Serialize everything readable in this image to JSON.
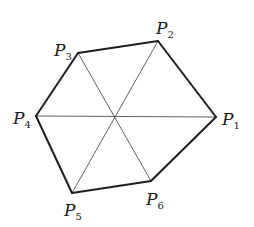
{
  "diagram": {
    "vertices": [
      {
        "id": "P1",
        "letter": "P",
        "sub": "1",
        "x": 216,
        "y": 117,
        "label_x": 222,
        "label_y": 125
      },
      {
        "id": "P2",
        "letter": "P",
        "sub": "2",
        "x": 158,
        "y": 41,
        "label_x": 156,
        "label_y": 34
      },
      {
        "id": "P3",
        "letter": "P",
        "sub": "3",
        "x": 78,
        "y": 53,
        "label_x": 54,
        "label_y": 56
      },
      {
        "id": "P4",
        "letter": "P",
        "sub": "4",
        "x": 36,
        "y": 116,
        "label_x": 13,
        "label_y": 124
      },
      {
        "id": "P5",
        "letter": "P",
        "sub": "5",
        "x": 72,
        "y": 193,
        "label_x": 64,
        "label_y": 216
      },
      {
        "id": "P6",
        "letter": "P",
        "sub": "6",
        "x": 151,
        "y": 181,
        "label_x": 146,
        "label_y": 205
      }
    ],
    "center": {
      "x": 114,
      "y": 116
    },
    "edges": [
      [
        "P1",
        "P2"
      ],
      [
        "P2",
        "P3"
      ],
      [
        "P3",
        "P4"
      ],
      [
        "P4",
        "P5"
      ],
      [
        "P5",
        "P6"
      ],
      [
        "P6",
        "P1"
      ]
    ],
    "diagonals": [
      [
        "P1",
        "P4"
      ],
      [
        "P2",
        "P5"
      ],
      [
        "P3",
        "P6"
      ]
    ],
    "colors": {
      "edge": "#1e1e1e",
      "diagonal": "#3a3a3a",
      "background": "#ffffff"
    }
  }
}
